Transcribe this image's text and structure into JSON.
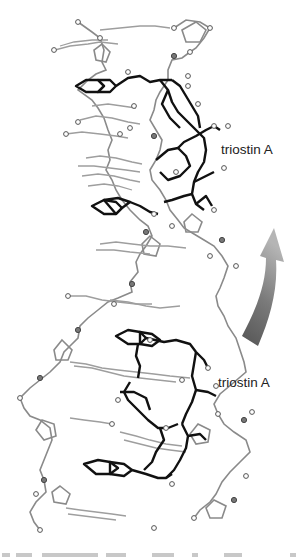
{
  "figure": {
    "type": "molecular-structure-diagram",
    "labels": [
      {
        "id": "upper",
        "text": "triostin A"
      },
      {
        "id": "lower",
        "text": "triostin A"
      }
    ],
    "arrow": {
      "direction": "curved-up",
      "colors": {
        "top": "#a9a9a9",
        "bottom": "#5a5a5a"
      }
    },
    "colors": {
      "ligand": "#111111",
      "dna": "#9a9a9a",
      "atom_fill": "#ffffff",
      "background": "#ffffff"
    }
  },
  "caption": {
    "visible": "partially cut off",
    "text": ""
  }
}
